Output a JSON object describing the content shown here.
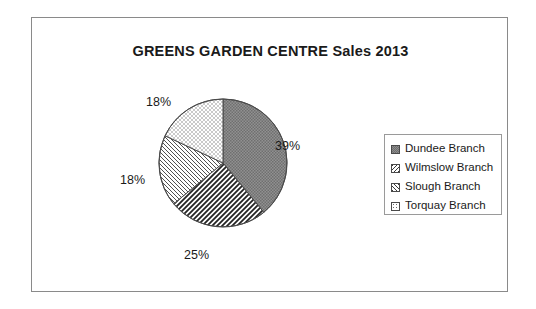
{
  "chart_frame": {
    "border_color": "#8a8a8a"
  },
  "chart_data": {
    "type": "pie",
    "title": "GREENS GARDEN CENTRE Sales 2013",
    "xlabel": "",
    "ylabel": "",
    "categories": [
      "Dundee Branch",
      "Wilmslow Branch",
      "Slough Branch",
      "Torquay Branch"
    ],
    "values": [
      39,
      25,
      18,
      18
    ],
    "value_unit": "%",
    "data_labels": [
      "39%",
      "25%",
      "18%",
      "18%"
    ],
    "slices": [
      {
        "label": "Dundee Branch",
        "value": 39,
        "data_label": "39%",
        "pattern": "dark-gray-stipple",
        "color": "#8e8e8e",
        "start_deg": 0,
        "end_deg": 140.4
      },
      {
        "label": "Slough Branch",
        "value": 25,
        "data_label": "25%",
        "pattern": "bold-diagonal-stripes-forward",
        "color": "#ffffff",
        "start_deg": 140.4,
        "end_deg": 230.4
      },
      {
        "label": "Wilmslow Branch",
        "value": 18,
        "data_label": "18%",
        "pattern": "fine-diagonal-hatch-back",
        "color": "#ffffff",
        "start_deg": 230.4,
        "end_deg": 295.2
      },
      {
        "label": "Torquay Branch",
        "value": 18,
        "data_label": "18%",
        "pattern": "light-dots",
        "color": "#ffffff",
        "start_deg": 295.2,
        "end_deg": 360
      }
    ],
    "legend": {
      "position": "right",
      "entries": [
        {
          "label": "Dundee Branch",
          "swatch": "dark-gray-stipple"
        },
        {
          "label": "Wilmslow Branch",
          "swatch": "fine-diagonal-hatch-back"
        },
        {
          "label": "Slough Branch",
          "swatch": "bold-diagonal-stripes-forward"
        },
        {
          "label": "Torquay Branch",
          "swatch": "light-dots"
        }
      ]
    },
    "grid": false,
    "start_angle_deg": 0,
    "direction": "clockwise"
  }
}
